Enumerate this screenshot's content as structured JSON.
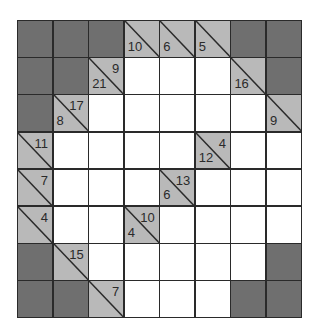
{
  "puzzle": {
    "type": "kakuro",
    "rows": 8,
    "cols": 8,
    "colors": {
      "block": "#6f6f6f",
      "clue": "#b9b9b9",
      "white": "#ffffff",
      "line": "#2a2a2a"
    },
    "grid": [
      [
        {
          "t": "B"
        },
        {
          "t": "B"
        },
        {
          "t": "B"
        },
        {
          "t": "C",
          "down": "10"
        },
        {
          "t": "C",
          "down": "6"
        },
        {
          "t": "C",
          "down": "5"
        },
        {
          "t": "B"
        },
        {
          "t": "B"
        }
      ],
      [
        {
          "t": "B"
        },
        {
          "t": "B"
        },
        {
          "t": "C",
          "down": "21",
          "right": "9"
        },
        {
          "t": "W"
        },
        {
          "t": "W"
        },
        {
          "t": "W"
        },
        {
          "t": "C",
          "down": "16"
        },
        {
          "t": "B"
        }
      ],
      [
        {
          "t": "B"
        },
        {
          "t": "C",
          "down": "8",
          "right": "17"
        },
        {
          "t": "W"
        },
        {
          "t": "W"
        },
        {
          "t": "W"
        },
        {
          "t": "W"
        },
        {
          "t": "W"
        },
        {
          "t": "C",
          "down": "9"
        }
      ],
      [
        {
          "t": "C",
          "right": "11"
        },
        {
          "t": "W"
        },
        {
          "t": "W"
        },
        {
          "t": "W"
        },
        {
          "t": "W"
        },
        {
          "t": "C",
          "down": "12",
          "right": "4"
        },
        {
          "t": "W"
        },
        {
          "t": "W"
        }
      ],
      [
        {
          "t": "C",
          "right": "7"
        },
        {
          "t": "W"
        },
        {
          "t": "W"
        },
        {
          "t": "W"
        },
        {
          "t": "C",
          "down": "6",
          "right": "13"
        },
        {
          "t": "W"
        },
        {
          "t": "W"
        },
        {
          "t": "W"
        }
      ],
      [
        {
          "t": "C",
          "right": "4"
        },
        {
          "t": "W"
        },
        {
          "t": "W"
        },
        {
          "t": "C",
          "down": "4",
          "right": "10"
        },
        {
          "t": "W"
        },
        {
          "t": "W"
        },
        {
          "t": "W"
        },
        {
          "t": "W"
        }
      ],
      [
        {
          "t": "B"
        },
        {
          "t": "C",
          "right": "15"
        },
        {
          "t": "W"
        },
        {
          "t": "W"
        },
        {
          "t": "W"
        },
        {
          "t": "W"
        },
        {
          "t": "W"
        },
        {
          "t": "B"
        }
      ],
      [
        {
          "t": "B"
        },
        {
          "t": "B"
        },
        {
          "t": "C",
          "right": "7"
        },
        {
          "t": "W"
        },
        {
          "t": "W"
        },
        {
          "t": "W"
        },
        {
          "t": "B"
        },
        {
          "t": "B"
        }
      ]
    ]
  }
}
